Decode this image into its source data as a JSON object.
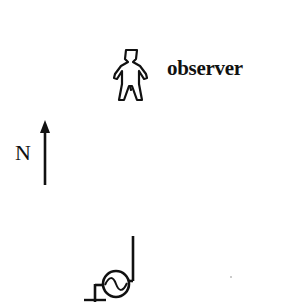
{
  "diagram": {
    "observer": {
      "label": "observer",
      "icon": "person-icon"
    },
    "compass": {
      "label": "N",
      "icon": "north-arrow-icon"
    },
    "source": {
      "icon": "ac-generator-icon",
      "ground_icon": "ground-icon"
    },
    "colors": {
      "ink": "#111111",
      "background": "#ffffff"
    }
  }
}
